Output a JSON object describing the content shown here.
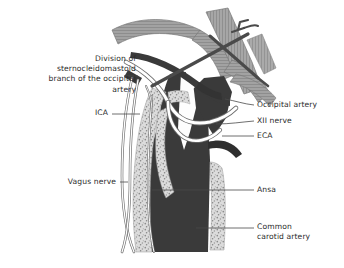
{
  "figure": {
    "background_color": "#ffffff"
  },
  "palette": {
    "artery_dark": "#3a3a3a",
    "artery_darker": "#2e2e2e",
    "muscle_gray": "#9d9d9d",
    "muscle_gray_light": "#b4b4b4",
    "instrument_dark": "#4a4a4a",
    "plaque_light": "#d8d8d8",
    "plaque_speckle": "#8a8a8a",
    "nerve_outline": "#6d6d6d",
    "nerve_fill": "#ffffff",
    "leader_line": "#4a4a4a",
    "text_color": "#2b2b2b"
  },
  "labels": {
    "division_scm": {
      "text": "Division of\nsternocleidomastoid\nbranch of the occipital\nartery",
      "align": "right",
      "x": 10,
      "y": 54,
      "width": 126
    },
    "ica": {
      "text": "ICA",
      "align": "right",
      "x": 72,
      "y": 108,
      "width": 36
    },
    "vagus_nerve": {
      "text": "Vagus nerve",
      "align": "right",
      "x": 48,
      "y": 177,
      "width": 68
    },
    "occipital_artery": {
      "text": "Occipital artery",
      "align": "left",
      "x": 257,
      "y": 100,
      "width": 86
    },
    "xii_nerve": {
      "text": "XII nerve",
      "align": "left",
      "x": 257,
      "y": 117,
      "width": 86
    },
    "eca": {
      "text": "ECA",
      "align": "left",
      "x": 257,
      "y": 131,
      "width": 86
    },
    "ansa": {
      "text": "Ansa",
      "align": "left",
      "x": 257,
      "y": 185,
      "width": 86
    },
    "common_carotid_artery": {
      "text": "Common\ncarotid artery",
      "align": "left",
      "x": 257,
      "y": 222,
      "width": 86
    }
  },
  "anatomy": {
    "structures": [
      {
        "name": "common-carotid-artery",
        "kind": "vessel",
        "color": "#3a3a3a"
      },
      {
        "name": "internal-carotid-artery",
        "kind": "vessel",
        "color": "#3a3a3a"
      },
      {
        "name": "external-carotid-artery",
        "kind": "vessel",
        "color": "#3a3a3a"
      },
      {
        "name": "eca-branch-stub",
        "kind": "vessel",
        "color": "#2e2e2e"
      },
      {
        "name": "atherosclerotic-plaque",
        "kind": "plaque",
        "color": "#d8d8d8"
      },
      {
        "name": "occipital-artery",
        "kind": "vessel",
        "color": "#3a3a3a"
      },
      {
        "name": "hypoglossal-nerve",
        "kind": "nerve",
        "color": "#ffffff"
      },
      {
        "name": "vagus-nerve",
        "kind": "nerve",
        "color": "#ffffff"
      },
      {
        "name": "ansa-cervicalis",
        "kind": "nerve",
        "color": "#ffffff"
      },
      {
        "name": "digastric-muscle",
        "kind": "muscle",
        "color": "#9d9d9d"
      },
      {
        "name": "sternocleidomastoid-muscle",
        "kind": "muscle",
        "color": "#9d9d9d"
      },
      {
        "name": "retractor-instrument",
        "kind": "instrument",
        "color": "#4a4a4a"
      },
      {
        "name": "sternocleidomastoid-branch-stub",
        "kind": "vessel",
        "color": "#3a3a3a"
      }
    ]
  }
}
